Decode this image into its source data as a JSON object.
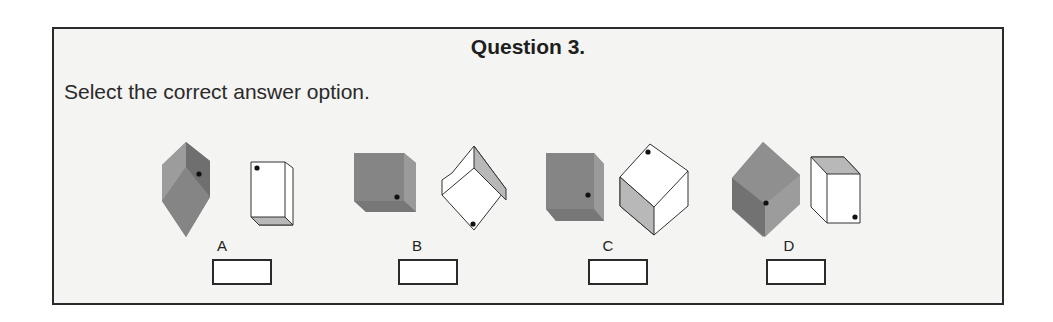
{
  "question": {
    "title": "Question 3.",
    "prompt": "Select the correct answer option."
  },
  "options": [
    {
      "label": "A"
    },
    {
      "label": "B"
    },
    {
      "label": "C"
    },
    {
      "label": "D"
    }
  ],
  "colors": {
    "frame_border": "#2a2a2a",
    "frame_bg": "#f4f4f2",
    "cube_dark": "#7a7a7a",
    "cube_mid": "#8e8e8e",
    "cube_light": "#a9a9a9",
    "cube_white": "#ffffff",
    "cube_shade": "#c4c4c4",
    "dot": "#111111"
  }
}
